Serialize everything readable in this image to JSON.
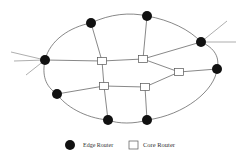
{
  "diagram": {
    "type": "network-topology",
    "colors": {
      "line": "#555555",
      "edge_fill": "#111111",
      "core_fill": "#ffffff",
      "core_stroke": "#555555"
    },
    "boundary_path": "M45,60 C50,40 70,27 91,23 C110,14 130,12 147,16 C170,20 190,30 201,42 C215,48 220,58 217,69 C215,90 185,115 147,120 C135,124 118,124 108,120 C85,118 65,106 57,94 C45,86 42,75 45,60 Z",
    "edge_routers": [
      {
        "id": "E1",
        "x": 45,
        "y": 60
      },
      {
        "id": "E2",
        "x": 91,
        "y": 23
      },
      {
        "id": "E3",
        "x": 147,
        "y": 16
      },
      {
        "id": "E4",
        "x": 201,
        "y": 42
      },
      {
        "id": "E5",
        "x": 217,
        "y": 69
      },
      {
        "id": "E6",
        "x": 57,
        "y": 94
      },
      {
        "id": "E7",
        "x": 108,
        "y": 120
      },
      {
        "id": "E8",
        "x": 147,
        "y": 120
      }
    ],
    "core_routers": [
      {
        "id": "C1",
        "x": 102,
        "y": 61
      },
      {
        "id": "C2",
        "x": 143,
        "y": 59
      },
      {
        "id": "C3",
        "x": 179,
        "y": 72
      },
      {
        "id": "C4",
        "x": 104,
        "y": 86
      },
      {
        "id": "C5",
        "x": 145,
        "y": 87
      }
    ],
    "links": [
      [
        "E1",
        "C1"
      ],
      [
        "C1",
        "C2"
      ],
      [
        "C2",
        "E4"
      ],
      [
        "C2",
        "C3"
      ],
      [
        "C3",
        "E5"
      ],
      [
        "E2",
        "C1"
      ],
      [
        "E3",
        "C2"
      ],
      [
        "C1",
        "C4"
      ],
      [
        "C4",
        "C5"
      ],
      [
        "C5",
        "C3"
      ],
      [
        "E6",
        "C4"
      ],
      [
        "C4",
        "E7"
      ],
      [
        "C5",
        "E8"
      ]
    ],
    "external_links": [
      {
        "from": "E1",
        "x": 11,
        "y": 52
      },
      {
        "from": "E1",
        "x": 14,
        "y": 61
      },
      {
        "from": "E1",
        "x": 26,
        "y": 75
      },
      {
        "from": "E4",
        "x": 227,
        "y": 21
      },
      {
        "from": "E4",
        "x": 236,
        "y": 42
      }
    ]
  },
  "legend": {
    "edge_label": "Edge Router",
    "core_label": "Core Router"
  }
}
